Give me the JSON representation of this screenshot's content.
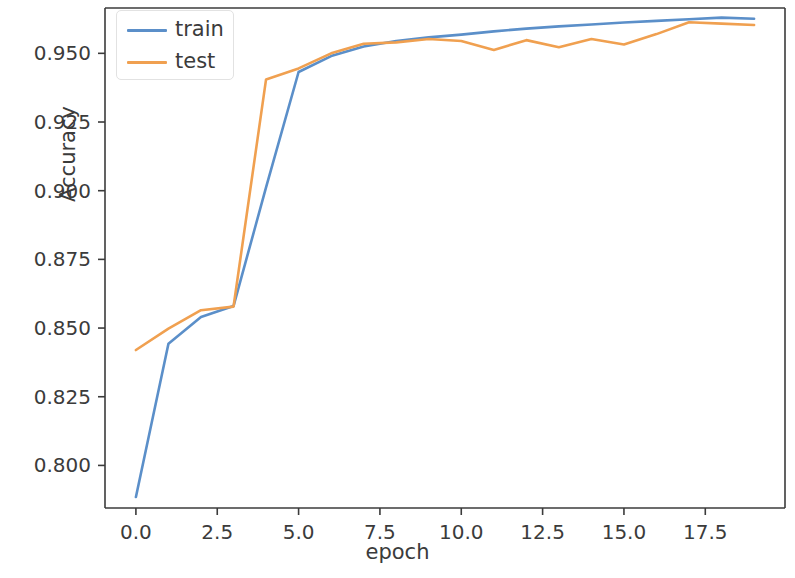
{
  "chart_data": {
    "type": "line",
    "title": "",
    "xlabel": "epoch",
    "ylabel": "Accuracy",
    "xlim": [
      -0.95,
      19.95
    ],
    "ylim": [
      0.7845,
      0.9665
    ],
    "grid": false,
    "legend_position": "upper left",
    "xticks": [
      0.0,
      2.5,
      5.0,
      7.5,
      10.0,
      12.5,
      15.0,
      17.5
    ],
    "xtick_labels": [
      "0.0",
      "2.5",
      "5.0",
      "7.5",
      "10.0",
      "12.5",
      "15.0",
      "17.5"
    ],
    "yticks": [
      0.8,
      0.825,
      0.85,
      0.875,
      0.9,
      0.925,
      0.95
    ],
    "ytick_labels": [
      "0.800",
      "0.825",
      "0.850",
      "0.875",
      "0.900",
      "0.925",
      "0.950"
    ],
    "x": [
      0,
      1,
      2,
      3,
      4,
      5,
      6,
      7,
      8,
      9,
      10,
      11,
      12,
      13,
      14,
      15,
      16,
      17,
      18,
      19
    ],
    "series": [
      {
        "name": "train",
        "color": "#5b8fc9",
        "values": [
          0.7885,
          0.8443,
          0.854,
          0.858,
          0.9012,
          0.9432,
          0.949,
          0.9525,
          0.9545,
          0.9558,
          0.9568,
          0.958,
          0.959,
          0.9598,
          0.9605,
          0.9612,
          0.9618,
          0.9624,
          0.963,
          0.9626
        ]
      },
      {
        "name": "test",
        "color": "#f0a050",
        "values": [
          0.842,
          0.8498,
          0.8565,
          0.8578,
          0.9405,
          0.9445,
          0.95,
          0.9535,
          0.954,
          0.9552,
          0.9545,
          0.9512,
          0.9548,
          0.9522,
          0.9552,
          0.9532,
          0.957,
          0.9613,
          0.9608,
          0.9603
        ]
      }
    ]
  },
  "legend": {
    "entries": [
      {
        "label": "train"
      },
      {
        "label": "test"
      }
    ]
  },
  "axes": {
    "spine_color": "#3b3b3b"
  }
}
